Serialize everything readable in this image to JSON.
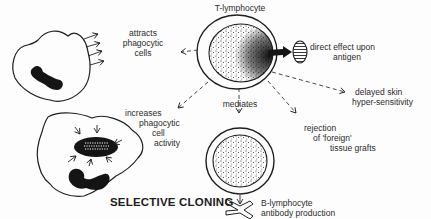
{
  "diagram": {
    "title": "SELECTIVE CLONING",
    "nodes": {
      "t_lymphocyte": {
        "label": "T-lymphocyte"
      },
      "phagocyte_attracted": {
        "label": "phagocytic cell (attracted)"
      },
      "phagocyte_active": {
        "label": "phagocytic cell (active)"
      },
      "b_lymphocyte": {
        "label": "B-lymphocyte cell"
      },
      "antigen": {
        "label": "antigen"
      },
      "antibody": {
        "label": "antibody"
      }
    },
    "labels": {
      "t_lymphocyte": "T-lymphocyte",
      "attracts": [
        "attracts",
        "phagocytic",
        "cells"
      ],
      "direct_effect": [
        "direct effect upon",
        "antigen"
      ],
      "increases": [
        "increases",
        "phagocytic",
        "cell",
        "activity"
      ],
      "mediates": "mediates",
      "delayed": [
        "delayed skin",
        "hyper-sensitivity"
      ],
      "rejection": [
        "rejection",
        "of 'foreign'",
        "tissue grafts"
      ],
      "b_lymphocyte": [
        "B-lymphocyte",
        "antibody production"
      ]
    },
    "edges": [
      {
        "from": "T-lymphocyte",
        "to": "attracts phagocytic cells",
        "style": "dashed"
      },
      {
        "from": "T-lymphocyte",
        "to": "increases phagocytic cell activity",
        "style": "dashed"
      },
      {
        "from": "T-lymphocyte",
        "to": "mediates B-lymphocyte",
        "style": "dashed"
      },
      {
        "from": "T-lymphocyte",
        "to": "rejection of 'foreign' tissue grafts",
        "style": "dashed"
      },
      {
        "from": "T-lymphocyte",
        "to": "delayed skin hyper-sensitivity",
        "style": "dashed"
      },
      {
        "from": "T-lymphocyte",
        "to": "direct effect upon antigen",
        "style": "solid"
      },
      {
        "from": "B-lymphocyte",
        "to": "antibody production",
        "style": "solid"
      }
    ],
    "colors": {
      "ink": "#1e1e1e",
      "paper": "#fdfdfd"
    }
  }
}
